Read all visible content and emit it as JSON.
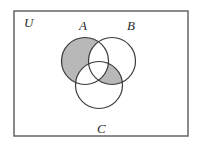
{
  "diagram": {
    "kind": "venn-diagram",
    "universe": {
      "label": "U",
      "label_x": 24,
      "label_y": 27,
      "rect": {
        "x": 14,
        "y": 11,
        "width": 174,
        "height": 125
      },
      "border_color": "#5a5a5a",
      "border_width": 1.4,
      "fill": "#ffffff"
    },
    "style": {
      "shade_color": "#b8b8b8",
      "circle_stroke": "#3a3a3a",
      "circle_stroke_width": 1.2,
      "circle_fill": "#ffffff",
      "text_color": "#2b2b2b"
    },
    "circles": [
      {
        "id": "A",
        "label": "A",
        "cx": 85,
        "cy": 61,
        "r": 23.5,
        "label_x": 79,
        "label_y": 30
      },
      {
        "id": "B",
        "label": "B",
        "cx": 112,
        "cy": 61,
        "r": 23.5,
        "label_x": 127,
        "label_y": 30
      },
      {
        "id": "C",
        "label": "C",
        "cx": 99,
        "cy": 85,
        "r": 23.5,
        "label_x": 97,
        "label_y": 133
      }
    ],
    "regions": [
      {
        "id": "A-only",
        "expression": "A only",
        "in": [
          "A"
        ],
        "out": [
          "B",
          "C"
        ],
        "shaded": true
      },
      {
        "id": "B-only",
        "expression": "B only",
        "in": [
          "B"
        ],
        "out": [
          "A",
          "C"
        ],
        "shaded": false
      },
      {
        "id": "C-only",
        "expression": "C only",
        "in": [
          "C"
        ],
        "out": [
          "A",
          "B"
        ],
        "shaded": false
      },
      {
        "id": "AB-only",
        "expression": "A and B only",
        "in": [
          "A",
          "B"
        ],
        "out": [
          "C"
        ],
        "shaded": false
      },
      {
        "id": "AC-only",
        "expression": "A and C only",
        "in": [
          "A",
          "C"
        ],
        "out": [
          "B"
        ],
        "shaded": true
      },
      {
        "id": "BC-only",
        "expression": "B and C only",
        "in": [
          "B",
          "C"
        ],
        "out": [
          "A"
        ],
        "shaded": true
      },
      {
        "id": "ABC",
        "expression": "A and B and C",
        "in": [
          "A",
          "B",
          "C"
        ],
        "out": [],
        "shaded": false
      },
      {
        "id": "outside",
        "expression": "outside all sets",
        "in": [],
        "out": [
          "A",
          "B",
          "C"
        ],
        "shaded": false
      }
    ]
  }
}
